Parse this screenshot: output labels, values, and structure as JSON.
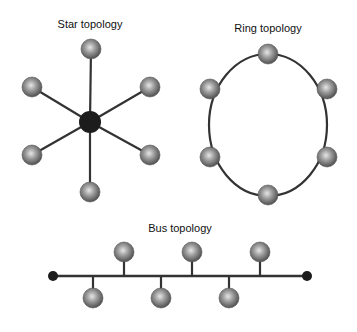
{
  "colors": {
    "link": "#333333",
    "hub": "#1c1c1c",
    "node_light": "#d8d8d8",
    "node_mid": "#8c8c8c",
    "node_dark": "#4a4a4a",
    "background": "#ffffff"
  },
  "star": {
    "title": "Star topology",
    "hub": {
      "x": 90,
      "y": 122,
      "r": 11
    },
    "nodes": [
      {
        "x": 91,
        "y": 49
      },
      {
        "x": 150,
        "y": 87
      },
      {
        "x": 150,
        "y": 155
      },
      {
        "x": 90,
        "y": 192
      },
      {
        "x": 32,
        "y": 155
      },
      {
        "x": 32,
        "y": 87
      }
    ]
  },
  "ring": {
    "title": "Ring topology",
    "center": {
      "x": 268,
      "y": 125
    },
    "rx": 59,
    "ry": 71,
    "nodes": [
      {
        "x": 268,
        "y": 54
      },
      {
        "x": 327,
        "y": 89
      },
      {
        "x": 327,
        "y": 157
      },
      {
        "x": 268,
        "y": 195
      },
      {
        "x": 210,
        "y": 157
      },
      {
        "x": 210,
        "y": 89
      }
    ]
  },
  "bus": {
    "title": "Bus topology",
    "line": {
      "x1": 53,
      "x2": 307,
      "y": 276
    },
    "terminators": [
      {
        "x": 53,
        "y": 276
      },
      {
        "x": 307,
        "y": 276
      }
    ],
    "upper_nodes": [
      {
        "x": 124,
        "y": 252
      },
      {
        "x": 192,
        "y": 252
      },
      {
        "x": 260,
        "y": 252
      }
    ],
    "lower_nodes": [
      {
        "x": 93,
        "y": 298
      },
      {
        "x": 161,
        "y": 298
      },
      {
        "x": 229,
        "y": 298
      }
    ]
  }
}
